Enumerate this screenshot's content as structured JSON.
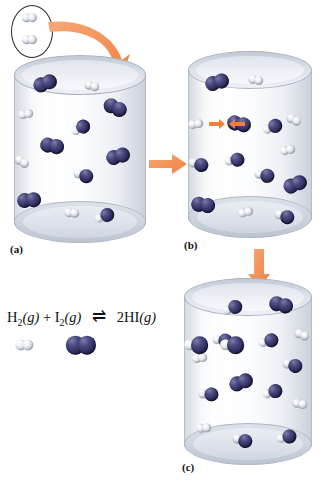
{
  "figure": {
    "panels": [
      {
        "id": "a",
        "label": "(a)",
        "caption": "(a)"
      },
      {
        "id": "b",
        "label": "(b)",
        "caption": "(b)"
      },
      {
        "id": "c",
        "label": "(c)",
        "caption": "(c)"
      }
    ]
  },
  "equation": {
    "reactant_h2": "H",
    "reactant_h2_sub": "2",
    "state_g1": "(g)",
    "plus": "+",
    "reactant_i2": "I",
    "reactant_i2_sub": "2",
    "state_g2": "(g)",
    "equilibrium_arrow": "⇌",
    "product": "2HI",
    "state_g3": "(g)",
    "full_text": "H2(g) + I2(g) ⇌ 2HI(g)"
  },
  "legend": {
    "h2_label": "H2 molecule",
    "i2_label": "I2 molecule",
    "hi_label": "HI molecule"
  },
  "colors": {
    "hydrogen": "#e6e9ee",
    "iodine": "#2e2d5e",
    "arrow": "#ef7f3c",
    "cylinder": "#d4dae3",
    "text": "#111111"
  },
  "icons": {
    "inset_oval": "oval-outline-icon",
    "big_arrow_a": "curved-arrow-icon",
    "arrow_ab": "right-arrow-icon",
    "arrow_bc": "down-arrow-icon",
    "collision_arrows": "collision-arrows-icon"
  },
  "panel_a": {
    "name": "cylinder-a",
    "description": "Vessel containing H2 and I2 molecules just after mixing",
    "molecules": [
      {
        "type": "I2",
        "x": 46,
        "y": 83,
        "angle": -20
      },
      {
        "type": "H2",
        "x": 92,
        "y": 86,
        "angle": 15
      },
      {
        "type": "H2",
        "x": 26,
        "y": 114,
        "angle": -10
      },
      {
        "type": "I2",
        "x": 116,
        "y": 108,
        "angle": 25
      },
      {
        "type": "HI",
        "x": 80,
        "y": 128,
        "angle": -25
      },
      {
        "type": "I2",
        "x": 53,
        "y": 146,
        "angle": 10
      },
      {
        "type": "H2",
        "x": 22,
        "y": 162,
        "angle": 30
      },
      {
        "type": "I2",
        "x": 119,
        "y": 156,
        "angle": -15
      },
      {
        "type": "HI",
        "x": 83,
        "y": 175,
        "angle": 20
      },
      {
        "type": "I2",
        "x": 30,
        "y": 200,
        "angle": -5
      },
      {
        "type": "H2",
        "x": 72,
        "y": 213,
        "angle": 5
      },
      {
        "type": "HI",
        "x": 104,
        "y": 216,
        "angle": -18
      }
    ]
  },
  "panel_b": {
    "name": "cylinder-b",
    "description": "Molecules colliding; H2 and I2 approach each other to react",
    "molecules": [
      {
        "type": "I2",
        "x": 218,
        "y": 82,
        "angle": -15
      },
      {
        "type": "H2",
        "x": 256,
        "y": 80,
        "angle": 10
      },
      {
        "type": "H2",
        "x": 196,
        "y": 124,
        "angle": -8
      },
      {
        "type": "I2",
        "x": 240,
        "y": 124,
        "angle": 12
      },
      {
        "type": "HI",
        "x": 272,
        "y": 127,
        "angle": -20
      },
      {
        "type": "H2",
        "x": 294,
        "y": 120,
        "angle": 25
      },
      {
        "type": "H2",
        "x": 288,
        "y": 150,
        "angle": -12
      },
      {
        "type": "HI",
        "x": 198,
        "y": 164,
        "angle": 18
      },
      {
        "type": "HI",
        "x": 234,
        "y": 160,
        "angle": -6
      },
      {
        "type": "HI",
        "x": 264,
        "y": 175,
        "angle": 14
      },
      {
        "type": "I2",
        "x": 296,
        "y": 184,
        "angle": -22
      },
      {
        "type": "I2",
        "x": 204,
        "y": 205,
        "angle": 8
      },
      {
        "type": "H2",
        "x": 246,
        "y": 212,
        "angle": -14
      },
      {
        "type": "HI",
        "x": 284,
        "y": 216,
        "angle": 20
      }
    ]
  },
  "panel_c": {
    "name": "cylinder-c",
    "description": "Equilibrium reached; mostly HI molecules present",
    "molecules": [
      {
        "type": "HI",
        "x": 232,
        "y": 308,
        "angle": -18
      },
      {
        "type": "I2",
        "x": 282,
        "y": 305,
        "angle": 14
      },
      {
        "type": "HI",
        "x": 222,
        "y": 340,
        "angle": 10
      },
      {
        "type": "HI",
        "x": 268,
        "y": 341,
        "angle": -12
      },
      {
        "type": "H2",
        "x": 302,
        "y": 335,
        "angle": 22
      },
      {
        "type": "H2",
        "x": 200,
        "y": 358,
        "angle": -8
      },
      {
        "type": "HI",
        "x": 292,
        "y": 365,
        "angle": 16
      },
      {
        "type": "I2",
        "x": 242,
        "y": 382,
        "angle": -20
      },
      {
        "type": "HI",
        "x": 208,
        "y": 394,
        "angle": 6
      },
      {
        "type": "HI",
        "x": 272,
        "y": 392,
        "angle": -15
      },
      {
        "type": "H2",
        "x": 300,
        "y": 404,
        "angle": 12
      },
      {
        "type": "H2",
        "x": 204,
        "y": 428,
        "angle": -6
      },
      {
        "type": "HI",
        "x": 242,
        "y": 440,
        "angle": 18
      },
      {
        "type": "HI",
        "x": 286,
        "y": 437,
        "angle": -10
      }
    ]
  },
  "inset": {
    "name": "h2-inset",
    "description": "Two H2 molecules highlighted before entering the vessel",
    "molecules": [
      {
        "type": "H2",
        "x": 30,
        "y": 18,
        "angle": 0
      },
      {
        "type": "H2",
        "x": 30,
        "y": 40,
        "angle": 0
      }
    ]
  }
}
